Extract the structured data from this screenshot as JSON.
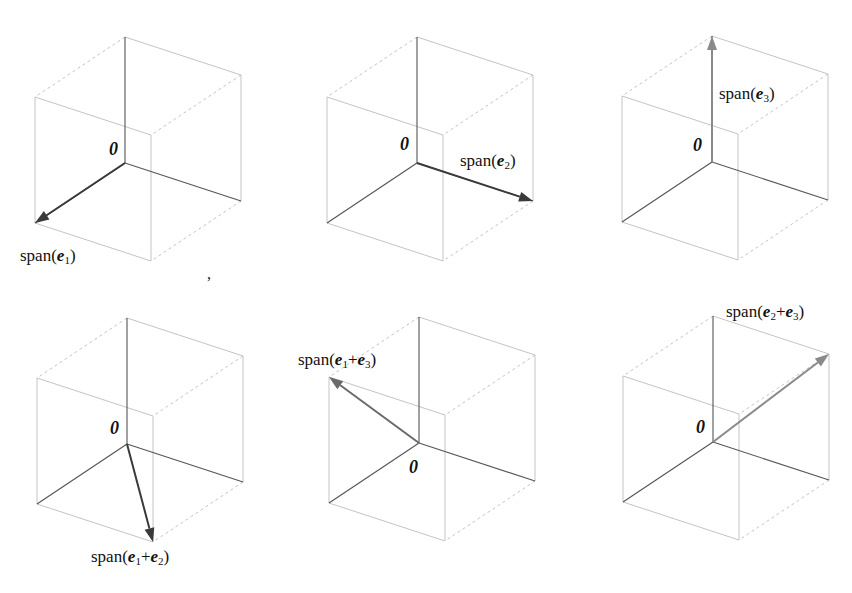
{
  "figure": {
    "basis_offsets": {
      "e1": [
        -90,
        60
      ],
      "e2": [
        116,
        38
      ],
      "e3": [
        0,
        -126
      ]
    },
    "colors": {
      "cube_edge": "#c4c4c4",
      "axis_edge": "#555555",
      "arrow_dark": "#3a3a3a",
      "arrow_light": "#8a8a8a",
      "text": "#111111"
    },
    "origin_symbol": "0",
    "separator": ",",
    "separator_pos": [
      207,
      266
    ],
    "panels": [
      {
        "id": "span-e1",
        "origin": [
          125,
          163
        ],
        "vector": [
          1,
          0,
          0
        ],
        "arrow_color": "#3a3a3a",
        "label_parts": [
          {
            "text": "span("
          },
          {
            "vec": "e",
            "sub": "1"
          },
          {
            "text": ")"
          }
        ],
        "label_text": "span(e1)",
        "label_pos": [
          20,
          247
        ],
        "origin_label_pos": [
          109,
          140
        ]
      },
      {
        "id": "span-e2",
        "origin": [
          417,
          163
        ],
        "vector": [
          0,
          1,
          0
        ],
        "arrow_color": "#3a3a3a",
        "label_parts": [
          {
            "text": "span("
          },
          {
            "vec": "e",
            "sub": "2"
          },
          {
            "text": ")"
          }
        ],
        "label_text": "span(e2)",
        "label_pos": [
          460,
          152
        ],
        "origin_label_pos": [
          400,
          135
        ]
      },
      {
        "id": "span-e3",
        "origin": [
          712,
          162
        ],
        "vector": [
          0,
          0,
          1
        ],
        "arrow_color": "#8a8a8a",
        "label_parts": [
          {
            "text": "span("
          },
          {
            "vec": "e",
            "sub": "3"
          },
          {
            "text": ")"
          }
        ],
        "label_text": "span(e3)",
        "label_pos": [
          719,
          85
        ],
        "origin_label_pos": [
          693,
          136
        ]
      },
      {
        "id": "span-e1-plus-e2",
        "origin": [
          127,
          444
        ],
        "vector": [
          1,
          1,
          0
        ],
        "arrow_color": "#3a3a3a",
        "label_parts": [
          {
            "text": "span("
          },
          {
            "vec": "e",
            "sub": "1"
          },
          {
            "text": "+"
          },
          {
            "vec": "e",
            "sub": "2"
          },
          {
            "text": ")"
          }
        ],
        "label_text": "span(e1+e2)",
        "label_pos": [
          91,
          548
        ],
        "origin_label_pos": [
          110,
          419
        ]
      },
      {
        "id": "span-e1-plus-e3",
        "origin": [
          419,
          443
        ],
        "vector": [
          1,
          0,
          1
        ],
        "arrow_color": "#6a6a6a",
        "label_parts": [
          {
            "text": "span("
          },
          {
            "vec": "e",
            "sub": "1"
          },
          {
            "text": "+"
          },
          {
            "vec": "e",
            "sub": "3"
          },
          {
            "text": ")"
          }
        ],
        "label_text": "span(e1+e3)",
        "label_pos": [
          298,
          351
        ],
        "origin_label_pos": [
          409,
          458
        ]
      },
      {
        "id": "span-e2-plus-e3",
        "origin": [
          713,
          442
        ],
        "vector": [
          0,
          1,
          1
        ],
        "arrow_color": "#8a8a8a",
        "label_parts": [
          {
            "text": "span("
          },
          {
            "vec": "e",
            "sub": "2"
          },
          {
            "text": "+"
          },
          {
            "vec": "e",
            "sub": "3"
          },
          {
            "text": ")"
          }
        ],
        "label_text": "span(e2+e3)",
        "label_pos": [
          726,
          303
        ],
        "origin_label_pos": [
          696,
          418
        ]
      }
    ]
  }
}
